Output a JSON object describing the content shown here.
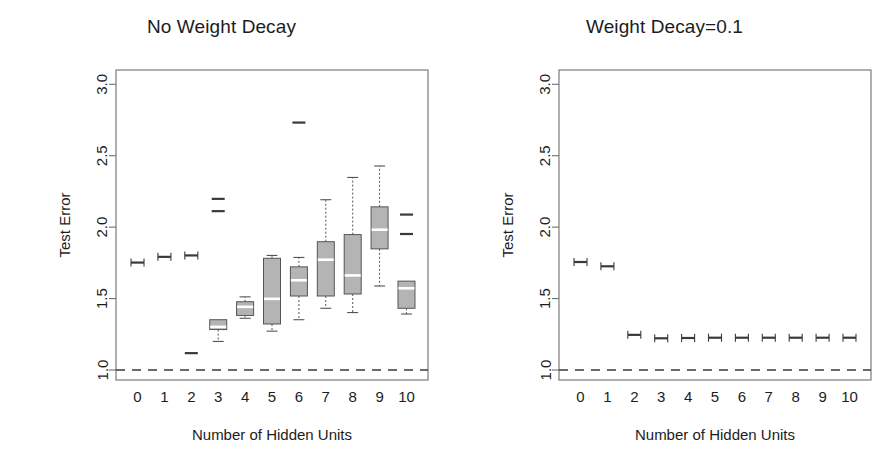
{
  "figure": {
    "width": 886,
    "height": 453,
    "background": "#ffffff"
  },
  "chart_data": [
    {
      "type": "box",
      "panel_id": "left",
      "title": "No Weight Decay",
      "xlabel": "Number of Hidden Units",
      "ylabel": "Test Error",
      "categories": [
        "0",
        "1",
        "2",
        "3",
        "4",
        "5",
        "6",
        "7",
        "8",
        "9",
        "10"
      ],
      "ylim": [
        0.93,
        3.1
      ],
      "yticks": [
        1.0,
        1.5,
        2.0,
        2.5,
        3.0
      ],
      "ytick_labels": [
        "1.0",
        "1.5",
        "2.0",
        "2.5",
        "3.0"
      ],
      "grid": false,
      "legend": "none",
      "reference_line": {
        "y": 1.0,
        "style": "dashed",
        "color": "#3a3a3a"
      },
      "boxes": [
        {
          "category": "0",
          "min": 1.735,
          "q1": 1.748,
          "median": 1.752,
          "q3": 1.757,
          "max": 1.772,
          "outliers": [],
          "degenerate": true
        },
        {
          "category": "1",
          "min": 1.773,
          "q1": 1.788,
          "median": 1.792,
          "q3": 1.796,
          "max": 1.812,
          "outliers": [],
          "degenerate": true
        },
        {
          "category": "2",
          "min": 1.795,
          "q1": 1.798,
          "median": 1.802,
          "q3": 1.808,
          "max": 1.812,
          "outliers": [
            1.118
          ],
          "degenerate": true
        },
        {
          "category": "3",
          "min": 1.2,
          "q1": 1.283,
          "median": 1.302,
          "q3": 1.352,
          "max": 1.352,
          "outliers": [
            2.112,
            2.198
          ],
          "degenerate": false
        },
        {
          "category": "4",
          "min": 1.362,
          "q1": 1.382,
          "median": 1.442,
          "q3": 1.478,
          "max": 1.512,
          "outliers": [],
          "degenerate": false
        },
        {
          "category": "5",
          "min": 1.272,
          "q1": 1.322,
          "median": 1.498,
          "q3": 1.782,
          "max": 1.802,
          "outliers": [],
          "degenerate": false
        },
        {
          "category": "6",
          "min": 1.352,
          "q1": 1.518,
          "median": 1.628,
          "q3": 1.722,
          "max": 1.788,
          "outliers": [
            2.732
          ],
          "degenerate": false
        },
        {
          "category": "7",
          "min": 1.432,
          "q1": 1.518,
          "median": 1.772,
          "q3": 1.898,
          "max": 2.192,
          "outliers": [],
          "degenerate": false
        },
        {
          "category": "8",
          "min": 1.402,
          "q1": 1.532,
          "median": 1.662,
          "q3": 1.948,
          "max": 2.348,
          "outliers": [],
          "degenerate": false
        },
        {
          "category": "9",
          "min": 1.588,
          "q1": 1.848,
          "median": 1.982,
          "q3": 2.142,
          "max": 2.428,
          "outliers": [],
          "degenerate": false
        },
        {
          "category": "10",
          "min": 1.392,
          "q1": 1.432,
          "median": 1.572,
          "q3": 1.622,
          "max": 1.622,
          "outliers": [
            1.952,
            2.088
          ],
          "degenerate": false
        }
      ]
    },
    {
      "type": "box",
      "panel_id": "right",
      "title": "Weight Decay=0.1",
      "xlabel": "Number of Hidden Units",
      "ylabel": "Test Error",
      "categories": [
        "0",
        "1",
        "2",
        "3",
        "4",
        "5",
        "6",
        "7",
        "8",
        "9",
        "10"
      ],
      "ylim": [
        0.93,
        3.1
      ],
      "yticks": [
        1.0,
        1.5,
        2.0,
        2.5,
        3.0
      ],
      "ytick_labels": [
        "1.0",
        "1.5",
        "2.0",
        "2.5",
        "3.0"
      ],
      "grid": false,
      "legend": "none",
      "reference_line": {
        "y": 1.0,
        "style": "dashed",
        "color": "#3a3a3a"
      },
      "boxes": [
        {
          "category": "0",
          "min": 1.742,
          "q1": 1.752,
          "median": 1.756,
          "q3": 1.76,
          "max": 1.772,
          "outliers": [],
          "degenerate": true
        },
        {
          "category": "1",
          "min": 1.712,
          "q1": 1.722,
          "median": 1.726,
          "q3": 1.732,
          "max": 1.742,
          "outliers": [],
          "degenerate": true
        },
        {
          "category": "2",
          "min": 1.232,
          "q1": 1.242,
          "median": 1.246,
          "q3": 1.25,
          "max": 1.262,
          "outliers": [],
          "degenerate": true
        },
        {
          "category": "3",
          "min": 1.208,
          "q1": 1.218,
          "median": 1.222,
          "q3": 1.226,
          "max": 1.238,
          "outliers": [],
          "degenerate": true
        },
        {
          "category": "4",
          "min": 1.212,
          "q1": 1.22,
          "median": 1.224,
          "q3": 1.228,
          "max": 1.238,
          "outliers": [],
          "degenerate": true
        },
        {
          "category": "5",
          "min": 1.212,
          "q1": 1.222,
          "median": 1.226,
          "q3": 1.23,
          "max": 1.242,
          "outliers": [],
          "degenerate": true
        },
        {
          "category": "6",
          "min": 1.212,
          "q1": 1.222,
          "median": 1.226,
          "q3": 1.23,
          "max": 1.242,
          "outliers": [],
          "degenerate": true
        },
        {
          "category": "7",
          "min": 1.212,
          "q1": 1.222,
          "median": 1.226,
          "q3": 1.23,
          "max": 1.242,
          "outliers": [],
          "degenerate": true
        },
        {
          "category": "8",
          "min": 1.212,
          "q1": 1.222,
          "median": 1.226,
          "q3": 1.23,
          "max": 1.242,
          "outliers": [],
          "degenerate": true
        },
        {
          "category": "9",
          "min": 1.212,
          "q1": 1.222,
          "median": 1.226,
          "q3": 1.23,
          "max": 1.242,
          "outliers": [],
          "degenerate": true
        },
        {
          "category": "10",
          "min": 1.212,
          "q1": 1.222,
          "median": 1.226,
          "q3": 1.23,
          "max": 1.242,
          "outliers": [],
          "degenerate": true
        }
      ]
    }
  ],
  "colors": {
    "box_fill": "#b4b4b4",
    "box_stroke": "#555555",
    "median": "#ffffff",
    "axis": "#6f6f6f",
    "text": "#1c1c1c",
    "reference": "#3a3a3a"
  },
  "geometry": {
    "plot_left": 116,
    "plot_right": 428,
    "plot_top": 70,
    "plot_bottom": 380,
    "box_width": 17
  }
}
